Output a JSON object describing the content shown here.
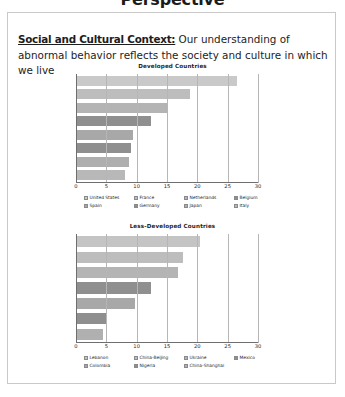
{
  "slide": {
    "title": "Perspective",
    "body": {
      "lead_in": "Social and Cultural Context:",
      "text": " Our understanding of abnormal behavior reflects the society and culture in which we live"
    }
  },
  "chart_data": [
    {
      "id": "developed",
      "type": "bar",
      "orientation": "horizontal",
      "title": "Developed Countries",
      "xlabel": "",
      "ylabel": "",
      "xlim": [
        0,
        30
      ],
      "xticks": [
        0,
        5,
        10,
        15,
        20,
        25,
        30
      ],
      "tick_labels": [
        "0",
        "5",
        "10",
        "15",
        "20",
        "25",
        "30"
      ],
      "grid": true,
      "legend_position": "bottom",
      "categories": [
        "United States",
        "France",
        "Netherlands",
        "Belgium",
        "Spain",
        "Germany",
        "Japan",
        "Italy"
      ],
      "values": [
        26.5,
        18.7,
        15.0,
        12.2,
        9.2,
        9.0,
        8.7,
        8.0
      ],
      "colors": [
        "#c9c9c9",
        "#bdbdbd",
        "#b4b4b4",
        "#8f8f8f",
        "#a8a8a8",
        "#8f8f8f",
        "#aeaeae",
        "#b8b8b8"
      ]
    },
    {
      "id": "less-developed",
      "type": "bar",
      "orientation": "horizontal",
      "title": "Less-Developed Countries",
      "xlabel": "",
      "ylabel": "",
      "xlim": [
        0,
        30
      ],
      "xticks": [
        0,
        5,
        10,
        15,
        20,
        25,
        30
      ],
      "tick_labels": [
        "0",
        "5",
        "10",
        "15",
        "20",
        "25",
        "30"
      ],
      "grid": true,
      "legend_position": "bottom",
      "categories": [
        "Lebanon",
        "China-Beijing",
        "Ukraine",
        "Mexico",
        "Colombia",
        "Nigeria",
        "China-Shanghai"
      ],
      "values": [
        20.4,
        17.6,
        16.8,
        12.2,
        9.6,
        4.8,
        4.3
      ],
      "colors": [
        "#c4c4c4",
        "#bdbdbd",
        "#b4b4b4",
        "#8f8f8f",
        "#a8a8a8",
        "#8f8f8f",
        "#b0b0b0"
      ]
    }
  ]
}
